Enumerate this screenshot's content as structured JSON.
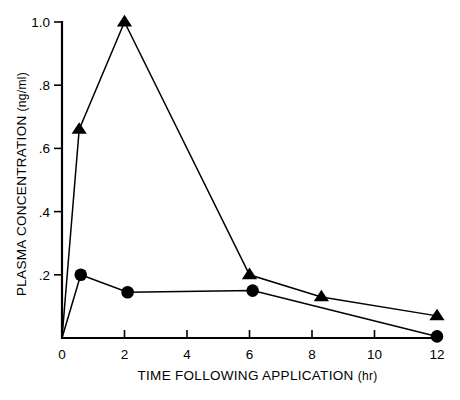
{
  "chart_data": {
    "type": "line",
    "title": "",
    "xlabel": "TIME FOLLOWING APPLICATION (hr)",
    "ylabel": "PLASMA CONCENTRATION (ng/ml)",
    "xlabel_main": "TIME FOLLOWING APPLICATION",
    "xlabel_unit": "(hr)",
    "ylabel_main": "PLASMA CONCENTRATION",
    "ylabel_unit": "(ng/ml)",
    "xlim": [
      0,
      12
    ],
    "ylim": [
      0,
      1.0
    ],
    "xticks": [
      0,
      2,
      4,
      6,
      8,
      10,
      12
    ],
    "xtick_labels": [
      "0",
      "2",
      "4",
      "6",
      "8",
      "10",
      "12"
    ],
    "yticks": [
      0.2,
      0.4,
      0.6,
      0.8,
      1.0
    ],
    "ytick_labels": [
      ".2",
      ".4",
      ".6",
      ".8",
      "1.0"
    ],
    "grid": false,
    "legend": "none",
    "line_color": "#000000",
    "series": [
      {
        "name": "triangle-series",
        "marker": "triangle",
        "color": "#000000",
        "x": [
          0,
          0.55,
          2.0,
          6.0,
          8.3,
          12.0
        ],
        "values": [
          0.0,
          0.66,
          1.0,
          0.2,
          0.13,
          0.07
        ]
      },
      {
        "name": "circle-series",
        "marker": "circle",
        "color": "#000000",
        "x": [
          0,
          0.6,
          2.1,
          6.1,
          12.0
        ],
        "values": [
          0.0,
          0.2,
          0.145,
          0.15,
          0.005
        ]
      }
    ]
  }
}
